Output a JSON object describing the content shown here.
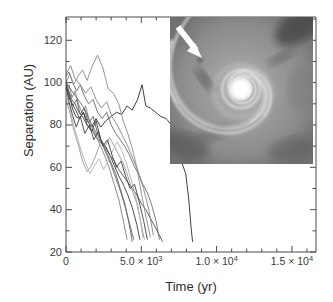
{
  "figure": {
    "background_color": "#ffffff",
    "frame_color": "#4a4a4a"
  },
  "axes": {
    "ylabel": "Separation (AU)",
    "xlabel": "Time (yr)",
    "y_ticks": [
      {
        "value": 20,
        "label": "20"
      },
      {
        "value": 40,
        "label": "40"
      },
      {
        "value": 60,
        "label": "60"
      },
      {
        "value": 80,
        "label": "80"
      },
      {
        "value": 100,
        "label": "100"
      },
      {
        "value": 120,
        "label": "120"
      }
    ],
    "x_ticks": [
      {
        "value": 0,
        "label": "0",
        "mantissa": "0",
        "exponent": ""
      },
      {
        "value": 5000,
        "label": "5.0 × 10",
        "mantissa": "5.0 × 10",
        "exponent": "3"
      },
      {
        "value": 10000,
        "label": "1.0 × 10",
        "mantissa": "1.0 × 10",
        "exponent": "4"
      },
      {
        "value": 15000,
        "label": "1.5 × 10",
        "mantissa": "1.5 × 10",
        "exponent": "4"
      }
    ]
  },
  "inset": {
    "name": "protoplanetary-disk-image",
    "description": "grayscale spiral disk simulation image",
    "arrow_label": "white-arrow-annotation",
    "center_color": "#ffffff",
    "background_color": "#8f8f8f"
  },
  "chart_data": {
    "type": "line",
    "title": "",
    "xlabel": "Time (yr)",
    "ylabel": "Separation (AU)",
    "xlim": [
      0,
      16600
    ],
    "ylim": [
      20,
      131
    ],
    "grid": false,
    "legend": null,
    "xtick_values": [
      0,
      5000,
      10000,
      15000
    ],
    "ytick_values": [
      20,
      40,
      60,
      80,
      100,
      120
    ],
    "series": [
      {
        "name": "run-1",
        "color": "#2b2b2b",
        "x": [
          0,
          200,
          420,
          650,
          900,
          1150,
          1400,
          1700,
          2000,
          2300,
          2650,
          3000,
          3350,
          3700,
          4050,
          4400,
          4750,
          5050,
          5300,
          5600,
          5950,
          6300,
          6650,
          7000,
          7350,
          7700,
          7950,
          8150,
          8300,
          8400
        ],
        "y": [
          99,
          95,
          88,
          84,
          83,
          86,
          82,
          79,
          83,
          79,
          82,
          84,
          86,
          85,
          89,
          87,
          92,
          99,
          89,
          88,
          86,
          84,
          83,
          80,
          72,
          62,
          57,
          45,
          32,
          25
        ]
      },
      {
        "name": "run-2",
        "color": "#4d4d4d",
        "x": [
          0,
          180,
          380,
          600,
          850,
          1100,
          1400,
          1700,
          2000,
          2300,
          2600,
          2900,
          3200,
          3500,
          3800,
          4100,
          4400,
          4700,
          5000,
          5300,
          5600,
          5900,
          6200,
          6400
        ],
        "y": [
          101,
          96,
          92,
          90,
          86,
          84,
          80,
          78,
          74,
          72,
          70,
          66,
          63,
          59,
          56,
          53,
          50,
          47,
          43,
          40,
          36,
          32,
          28,
          25
        ]
      },
      {
        "name": "run-3",
        "color": "#6a6a6a",
        "x": [
          0,
          200,
          450,
          700,
          950,
          1200,
          1500,
          1800,
          2100,
          2400,
          2700,
          3000,
          3300,
          3600,
          3900,
          4200,
          4500,
          4800,
          5100,
          5400,
          5700,
          6000,
          6200
        ],
        "y": [
          103,
          105,
          100,
          96,
          99,
          94,
          90,
          92,
          86,
          83,
          86,
          80,
          76,
          73,
          70,
          66,
          61,
          57,
          52,
          48,
          42,
          34,
          26
        ]
      },
      {
        "name": "run-4",
        "color": "#8a8a8a",
        "x": [
          0,
          250,
          500,
          800,
          1100,
          1400,
          1750,
          2100,
          2450,
          2800,
          3150,
          3500,
          3800,
          4100,
          4400,
          4700,
          5000,
          5300,
          5600
        ],
        "y": [
          100,
          104,
          99,
          103,
          106,
          101,
          108,
          113,
          107,
          97,
          95,
          90,
          82,
          76,
          69,
          60,
          48,
          37,
          27
        ]
      },
      {
        "name": "run-5",
        "color": "#3a3a3a",
        "x": [
          0,
          200,
          400,
          650,
          900,
          1150,
          1400,
          1700,
          2000,
          2300,
          2600,
          2900,
          3200,
          3500,
          3800,
          4100,
          4400,
          4700,
          4900
        ],
        "y": [
          98,
          93,
          90,
          87,
          83,
          86,
          80,
          77,
          82,
          73,
          70,
          66,
          61,
          56,
          52,
          47,
          41,
          33,
          26
        ]
      },
      {
        "name": "run-6",
        "color": "#5c5c5c",
        "x": [
          0,
          220,
          450,
          700,
          950,
          1200,
          1500,
          1800,
          2100,
          2400,
          2700,
          3000,
          3300,
          3600,
          3900,
          4200,
          4400
        ],
        "y": [
          97,
          94,
          89,
          92,
          85,
          88,
          81,
          84,
          76,
          72,
          67,
          62,
          57,
          50,
          43,
          33,
          25
        ]
      },
      {
        "name": "run-7",
        "color": "#7c7c7c",
        "x": [
          0,
          200,
          400,
          600,
          820,
          1050,
          1300,
          1550,
          1800,
          2050,
          2300,
          2600,
          2900,
          3200,
          3500,
          3800,
          4050
        ],
        "y": [
          96,
          99,
          93,
          96,
          90,
          86,
          89,
          82,
          78,
          74,
          70,
          65,
          59,
          52,
          45,
          35,
          26
        ]
      },
      {
        "name": "run-8",
        "color": "#9a9a9a",
        "x": [
          0,
          250,
          500,
          800,
          1100,
          1400,
          1700,
          2000,
          2300,
          2600,
          2900,
          3200,
          3500,
          3800,
          4100,
          4400,
          4700,
          5000,
          5200
        ],
        "y": [
          92,
          86,
          78,
          71,
          63,
          58,
          61,
          66,
          72,
          70,
          74,
          70,
          66,
          62,
          56,
          49,
          43,
          33,
          26
        ]
      },
      {
        "name": "run-9",
        "color": "#696969",
        "x": [
          0,
          300,
          600,
          900,
          1200,
          1500,
          1800,
          2100,
          2400,
          2700,
          3000,
          3300,
          3600,
          3900,
          4200,
          4500
        ],
        "y": [
          100,
          97,
          94,
          91,
          88,
          83,
          79,
          75,
          71,
          66,
          61,
          55,
          49,
          42,
          34,
          26
        ]
      },
      {
        "name": "run-10",
        "color": "#b0b0b0",
        "x": [
          0,
          250,
          500,
          750,
          1000,
          1300,
          1600,
          1900,
          2200,
          2500,
          2800,
          3100,
          3400,
          3700,
          4000,
          4300,
          4600,
          4900,
          5100
        ],
        "y": [
          95,
          88,
          80,
          74,
          68,
          62,
          57,
          61,
          64,
          59,
          63,
          68,
          72,
          68,
          62,
          55,
          47,
          37,
          27
        ]
      },
      {
        "name": "run-11",
        "color": "#404040",
        "x": [
          0,
          200,
          420,
          680,
          950,
          1250,
          1550,
          1850,
          2150,
          2450,
          2750,
          3050,
          3350,
          3650,
          3950,
          4250,
          4550,
          4850,
          5150,
          5400
        ],
        "y": [
          99,
          91,
          85,
          79,
          84,
          76,
          80,
          73,
          77,
          70,
          73,
          66,
          60,
          63,
          56,
          50,
          52,
          44,
          35,
          26
        ]
      },
      {
        "name": "run-12",
        "color": "#868686",
        "x": [
          0,
          300,
          600,
          950,
          1300,
          1650,
          2000,
          2350,
          2700,
          3050,
          3400,
          3750,
          4100,
          4450,
          4800,
          5150,
          5500,
          5800
        ],
        "y": [
          104,
          108,
          102,
          99,
          95,
          98,
          92,
          88,
          91,
          84,
          80,
          75,
          70,
          64,
          58,
          50,
          40,
          28
        ]
      }
    ]
  }
}
